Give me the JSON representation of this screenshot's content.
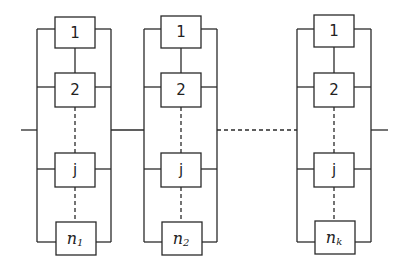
{
  "diagram": {
    "type": "series-parallel reliability block diagram",
    "stroke_color": "#2a2a2a",
    "background": "#ffffff",
    "subsystems": [
      {
        "id": "subsystem-1",
        "blocks": [
          {
            "label": "1"
          },
          {
            "label": "2"
          },
          {
            "label": "j"
          },
          {
            "label_base": "n",
            "label_sub": "1"
          }
        ]
      },
      {
        "id": "subsystem-2",
        "blocks": [
          {
            "label": "1"
          },
          {
            "label": "2"
          },
          {
            "label": "j"
          },
          {
            "label_base": "n",
            "label_sub": "2"
          }
        ]
      },
      {
        "id": "subsystem-k",
        "blocks": [
          {
            "label": "1"
          },
          {
            "label": "2"
          },
          {
            "label": "j"
          },
          {
            "label_base": "n",
            "label_sub": "k"
          }
        ]
      }
    ],
    "connections": {
      "input_line": true,
      "series_link_1_2": "solid",
      "series_link_2_k": "dashed",
      "output_line": true
    }
  }
}
